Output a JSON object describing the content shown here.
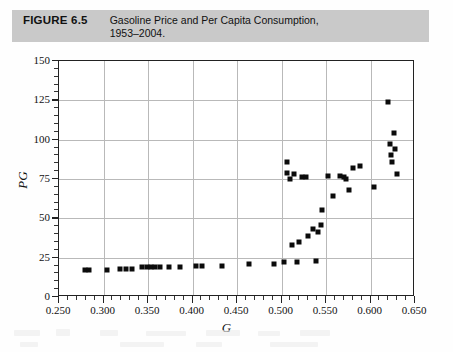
{
  "figure": {
    "label": "FIGURE 6.5",
    "title_line1": "Gasoline Price and Per Capita Consumption,",
    "title_line2": "1953–2004.",
    "band_color": "#c9c9c9"
  },
  "chart_data": {
    "type": "scatter",
    "xlabel": "G",
    "ylabel": "PG",
    "xlim": [
      0.25,
      0.65
    ],
    "ylim": [
      0,
      150
    ],
    "xticks": [
      "0.250",
      "0.300",
      "0.350",
      "0.400",
      "0.450",
      "0.500",
      "0.550",
      "0.600",
      "0.650"
    ],
    "xtick_values": [
      0.25,
      0.3,
      0.35,
      0.4,
      0.45,
      0.5,
      0.55,
      0.6,
      0.65
    ],
    "yticks": [
      "0",
      "25",
      "50",
      "75",
      "100",
      "125",
      "150"
    ],
    "ytick_values": [
      0,
      25,
      50,
      75,
      100,
      125,
      150
    ],
    "grid": true,
    "legend": false,
    "marker": "square",
    "marker_color": "#0b0b0b",
    "points": [
      {
        "x": 0.279,
        "y": 17
      },
      {
        "x": 0.284,
        "y": 17
      },
      {
        "x": 0.304,
        "y": 17
      },
      {
        "x": 0.319,
        "y": 18
      },
      {
        "x": 0.325,
        "y": 18
      },
      {
        "x": 0.332,
        "y": 18
      },
      {
        "x": 0.343,
        "y": 19
      },
      {
        "x": 0.349,
        "y": 19
      },
      {
        "x": 0.353,
        "y": 19
      },
      {
        "x": 0.358,
        "y": 19
      },
      {
        "x": 0.364,
        "y": 19
      },
      {
        "x": 0.374,
        "y": 19
      },
      {
        "x": 0.386,
        "y": 19
      },
      {
        "x": 0.404,
        "y": 20
      },
      {
        "x": 0.411,
        "y": 20
      },
      {
        "x": 0.433,
        "y": 20
      },
      {
        "x": 0.463,
        "y": 21
      },
      {
        "x": 0.492,
        "y": 21
      },
      {
        "x": 0.503,
        "y": 22
      },
      {
        "x": 0.506,
        "y": 79
      },
      {
        "x": 0.506,
        "y": 86
      },
      {
        "x": 0.509,
        "y": 75
      },
      {
        "x": 0.512,
        "y": 33
      },
      {
        "x": 0.514,
        "y": 78
      },
      {
        "x": 0.517,
        "y": 22
      },
      {
        "x": 0.52,
        "y": 35
      },
      {
        "x": 0.523,
        "y": 76
      },
      {
        "x": 0.527,
        "y": 76
      },
      {
        "x": 0.53,
        "y": 39
      },
      {
        "x": 0.535,
        "y": 43
      },
      {
        "x": 0.539,
        "y": 23
      },
      {
        "x": 0.541,
        "y": 41
      },
      {
        "x": 0.544,
        "y": 46
      },
      {
        "x": 0.546,
        "y": 55
      },
      {
        "x": 0.552,
        "y": 77
      },
      {
        "x": 0.558,
        "y": 64
      },
      {
        "x": 0.566,
        "y": 77
      },
      {
        "x": 0.57,
        "y": 76
      },
      {
        "x": 0.573,
        "y": 75
      },
      {
        "x": 0.576,
        "y": 68
      },
      {
        "x": 0.58,
        "y": 82
      },
      {
        "x": 0.588,
        "y": 83
      },
      {
        "x": 0.604,
        "y": 70
      },
      {
        "x": 0.62,
        "y": 124
      },
      {
        "x": 0.622,
        "y": 97
      },
      {
        "x": 0.623,
        "y": 90
      },
      {
        "x": 0.624,
        "y": 86
      },
      {
        "x": 0.626,
        "y": 104
      },
      {
        "x": 0.627,
        "y": 94
      },
      {
        "x": 0.63,
        "y": 78
      }
    ]
  }
}
